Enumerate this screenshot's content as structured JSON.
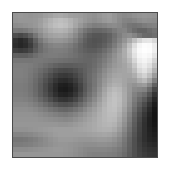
{
  "figure": {
    "type": "raster-image",
    "title": "",
    "caption": "",
    "colormap": "grayscale",
    "background_color": "#ffffff",
    "frame": {
      "border_color": "#4a4a4a",
      "border_width_px": 1,
      "left_px": 12,
      "top_px": 12,
      "width_px": 146,
      "height_px": 146
    },
    "raster": {
      "grid_width": 29,
      "grid_height": 29,
      "value_range": [
        0,
        255
      ],
      "description": "Pixelated low-resolution grayscale scene: a dark diagonal band crossing from upper-left to lower-right, a very bright white elongated streak in the upper-right, a dark patch at the middle-right edge, and a lighter horizontal band across the bottom.",
      "pixels": [
        [
          150,
          152,
          150,
          148,
          150,
          152,
          158,
          162,
          168,
          170,
          166,
          160,
          158,
          156,
          152,
          148,
          145,
          150,
          155,
          158,
          150,
          142,
          138,
          140,
          145,
          148,
          150,
          148,
          146
        ],
        [
          148,
          150,
          150,
          150,
          152,
          158,
          168,
          178,
          186,
          190,
          186,
          178,
          168,
          160,
          152,
          146,
          142,
          146,
          152,
          156,
          150,
          140,
          132,
          130,
          134,
          140,
          144,
          142,
          140
        ],
        [
          140,
          142,
          145,
          148,
          152,
          160,
          172,
          182,
          190,
          194,
          190,
          180,
          166,
          152,
          140,
          132,
          126,
          128,
          132,
          138,
          140,
          136,
          126,
          118,
          115,
          118,
          124,
          128,
          130
        ],
        [
          120,
          118,
          122,
          130,
          140,
          150,
          162,
          172,
          178,
          180,
          176,
          166,
          150,
          132,
          118,
          108,
          102,
          102,
          106,
          112,
          122,
          130,
          132,
          120,
          108,
          100,
          100,
          108,
          115
        ],
        [
          78,
          72,
          80,
          96,
          118,
          138,
          152,
          160,
          164,
          166,
          162,
          152,
          138,
          120,
          104,
          92,
          86,
          86,
          90,
          98,
          112,
          126,
          138,
          142,
          132,
          118,
          106,
          104,
          110
        ],
        [
          48,
          40,
          48,
          68,
          96,
          120,
          136,
          146,
          150,
          150,
          146,
          138,
          126,
          110,
          96,
          86,
          82,
          84,
          90,
          100,
          116,
          132,
          148,
          168,
          192,
          214,
          228,
          230,
          216
        ],
        [
          44,
          38,
          44,
          60,
          86,
          108,
          122,
          130,
          134,
          134,
          130,
          124,
          114,
          102,
          92,
          86,
          84,
          88,
          96,
          108,
          124,
          142,
          162,
          190,
          222,
          245,
          252,
          250,
          236
        ],
        [
          62,
          58,
          62,
          72,
          92,
          108,
          118,
          124,
          126,
          126,
          124,
          118,
          110,
          102,
          96,
          92,
          92,
          98,
          108,
          120,
          136,
          152,
          172,
          200,
          232,
          250,
          254,
          252,
          238
        ],
        [
          96,
          94,
          94,
          100,
          110,
          118,
          122,
          124,
          124,
          122,
          120,
          116,
          112,
          106,
          102,
          100,
          102,
          108,
          118,
          130,
          144,
          158,
          172,
          196,
          226,
          246,
          250,
          246,
          228
        ],
        [
          118,
          118,
          118,
          118,
          120,
          120,
          118,
          116,
          114,
          112,
          110,
          108,
          106,
          104,
          102,
          102,
          106,
          114,
          124,
          136,
          148,
          158,
          168,
          186,
          214,
          238,
          244,
          236,
          212
        ],
        [
          126,
          126,
          126,
          124,
          120,
          116,
          110,
          104,
          98,
          94,
          92,
          92,
          94,
          96,
          98,
          102,
          108,
          118,
          130,
          142,
          152,
          158,
          164,
          176,
          200,
          228,
          236,
          224,
          196
        ],
        [
          128,
          128,
          126,
          122,
          116,
          108,
          100,
          90,
          80,
          74,
          72,
          74,
          80,
          88,
          96,
          104,
          112,
          124,
          138,
          150,
          158,
          162,
          164,
          170,
          188,
          216,
          226,
          210,
          178
        ],
        [
          128,
          128,
          126,
          120,
          112,
          102,
          90,
          78,
          66,
          58,
          56,
          60,
          70,
          82,
          94,
          106,
          116,
          130,
          144,
          156,
          164,
          166,
          164,
          164,
          174,
          198,
          210,
          190,
          156
        ],
        [
          126,
          126,
          124,
          118,
          108,
          96,
          82,
          68,
          54,
          44,
          42,
          48,
          60,
          76,
          92,
          106,
          118,
          134,
          150,
          162,
          170,
          170,
          164,
          158,
          160,
          176,
          186,
          164,
          128
        ],
        [
          124,
          124,
          122,
          116,
          106,
          92,
          76,
          60,
          44,
          32,
          30,
          36,
          50,
          68,
          88,
          104,
          118,
          136,
          154,
          168,
          176,
          174,
          164,
          152,
          146,
          152,
          156,
          134,
          98
        ],
        [
          124,
          124,
          122,
          116,
          106,
          92,
          76,
          58,
          42,
          28,
          26,
          32,
          46,
          66,
          88,
          106,
          122,
          142,
          162,
          178,
          186,
          182,
          168,
          152,
          138,
          134,
          130,
          106,
          72
        ],
        [
          126,
          126,
          124,
          118,
          108,
          94,
          80,
          64,
          48,
          36,
          34,
          40,
          54,
          74,
          94,
          112,
          128,
          148,
          168,
          184,
          192,
          186,
          170,
          150,
          130,
          118,
          108,
          84,
          52
        ],
        [
          130,
          130,
          128,
          124,
          116,
          104,
          92,
          78,
          64,
          54,
          52,
          58,
          70,
          88,
          106,
          122,
          138,
          156,
          174,
          188,
          194,
          188,
          170,
          148,
          124,
          106,
          90,
          66,
          38
        ],
        [
          136,
          136,
          136,
          132,
          126,
          118,
          108,
          98,
          88,
          80,
          78,
          82,
          92,
          106,
          120,
          134,
          148,
          164,
          178,
          190,
          194,
          186,
          168,
          144,
          118,
          96,
          76,
          52,
          28
        ],
        [
          142,
          142,
          142,
          140,
          136,
          130,
          124,
          116,
          110,
          104,
          102,
          106,
          114,
          124,
          136,
          148,
          158,
          170,
          182,
          190,
          192,
          182,
          162,
          138,
          110,
          86,
          64,
          42,
          22
        ],
        [
          146,
          146,
          146,
          146,
          144,
          140,
          136,
          132,
          128,
          124,
          122,
          126,
          132,
          140,
          148,
          156,
          164,
          174,
          182,
          188,
          188,
          176,
          156,
          130,
          102,
          78,
          56,
          36,
          20
        ],
        [
          148,
          148,
          148,
          148,
          148,
          146,
          144,
          142,
          140,
          138,
          136,
          138,
          144,
          150,
          156,
          162,
          168,
          176,
          182,
          186,
          184,
          170,
          150,
          124,
          96,
          72,
          50,
          32,
          20
        ],
        [
          150,
          150,
          150,
          150,
          150,
          150,
          150,
          150,
          150,
          148,
          148,
          150,
          154,
          158,
          162,
          166,
          170,
          176,
          180,
          182,
          178,
          164,
          144,
          118,
          92,
          68,
          48,
          32,
          22
        ],
        [
          146,
          146,
          146,
          148,
          150,
          152,
          154,
          156,
          158,
          158,
          158,
          158,
          160,
          162,
          164,
          166,
          170,
          174,
          176,
          176,
          170,
          156,
          136,
          112,
          88,
          66,
          48,
          34,
          26
        ],
        [
          132,
          132,
          134,
          136,
          140,
          144,
          148,
          152,
          156,
          158,
          158,
          158,
          158,
          158,
          158,
          160,
          162,
          164,
          166,
          164,
          158,
          146,
          128,
          106,
          84,
          64,
          48,
          36,
          30
        ],
        [
          118,
          118,
          120,
          124,
          128,
          134,
          140,
          146,
          150,
          154,
          154,
          154,
          152,
          150,
          150,
          150,
          152,
          154,
          154,
          152,
          146,
          136,
          120,
          100,
          80,
          62,
          48,
          38,
          34
        ],
        [
          124,
          124,
          126,
          128,
          132,
          136,
          140,
          144,
          148,
          150,
          150,
          148,
          146,
          144,
          142,
          142,
          142,
          144,
          144,
          142,
          138,
          130,
          116,
          98,
          80,
          64,
          52,
          44,
          40
        ],
        [
          140,
          140,
          140,
          142,
          144,
          146,
          148,
          150,
          152,
          152,
          150,
          148,
          144,
          140,
          136,
          134,
          134,
          134,
          134,
          132,
          128,
          122,
          112,
          96,
          80,
          66,
          56,
          50,
          48
        ],
        [
          150,
          150,
          150,
          150,
          150,
          150,
          150,
          150,
          150,
          150,
          148,
          146,
          142,
          138,
          134,
          130,
          128,
          128,
          128,
          126,
          124,
          118,
          108,
          94,
          80,
          68,
          60,
          54,
          52
        ]
      ]
    }
  }
}
